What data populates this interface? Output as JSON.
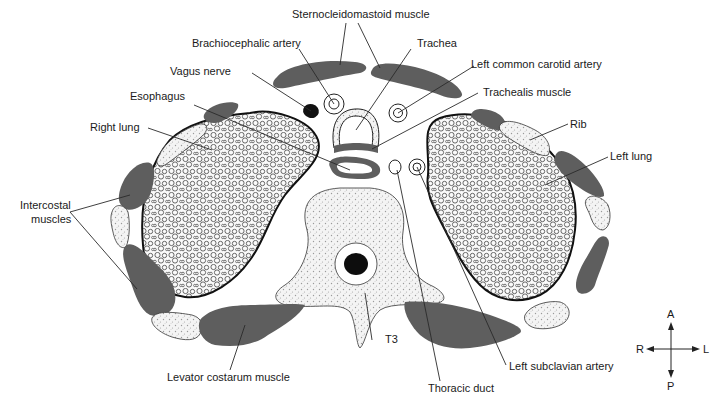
{
  "figure": {
    "labels": {
      "sternocleidomastoid": "Sternocleidomastoid muscle",
      "brachiocephalic": "Brachiocephalic artery",
      "trachea": "Trachea",
      "left_common_carotid": "Left common carotid artery",
      "vagus": "Vagus nerve",
      "trachealis": "Trachealis muscle",
      "esophagus": "Esophagus",
      "right_lung": "Right lung",
      "rib": "Rib",
      "left_lung": "Left lung",
      "intercostal_1": "Intercostal",
      "intercostal_2": "muscles",
      "t3": "T3",
      "levator": "Levator costarum muscle",
      "thoracic_duct": "Thoracic duct",
      "left_subclavian": "Left subclavian artery"
    },
    "orientation": {
      "anterior": "A",
      "posterior": "P",
      "right": "R",
      "left": "L"
    },
    "colors": {
      "muscle": "#5e5e5e",
      "bone_dots": "#9a9a9a",
      "outline": "#111111",
      "background": "#ffffff"
    }
  }
}
